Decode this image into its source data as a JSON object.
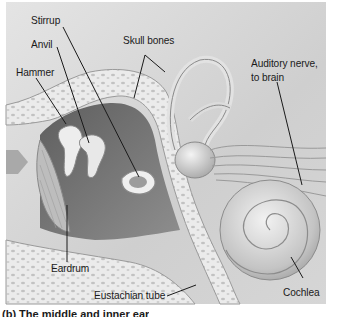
{
  "figure": {
    "type": "anatomical-diagram",
    "subject": "middle and inner ear",
    "labels": {
      "stirrup": "Stirrup",
      "anvil": "Anvil",
      "hammer": "Hammer",
      "skull_bones": "Skull bones",
      "auditory_nerve_line1": "Auditory nerve,",
      "auditory_nerve_line2": "to brain",
      "eardrum": "Eardrum",
      "eustachian_tube": "Eustachian tube",
      "cochlea": "Cochlea"
    },
    "caption": "(b) The middle and inner ear",
    "colors": {
      "background": "#d9d9d9",
      "bone": "#ececec",
      "cavity": "#7a7a7a",
      "leader_line": "#1a1a1a",
      "text": "#1a1a1a"
    }
  }
}
